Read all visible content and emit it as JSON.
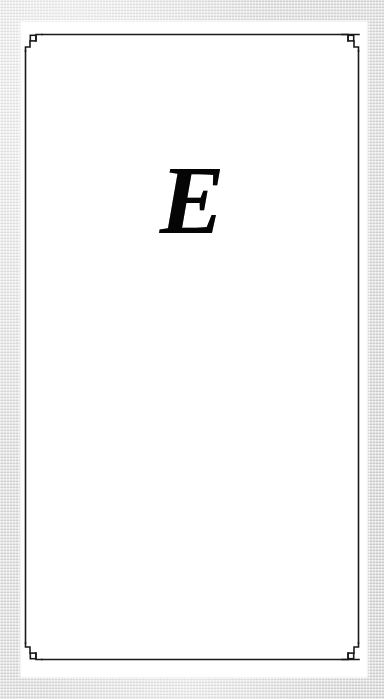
{
  "page": {
    "kind": "scanned-book-page",
    "role": "chapter-opening-page",
    "paper_color": "#ffffff",
    "scan_margin_color": "#dcdcdc",
    "ink_color": "#1a1a1a"
  },
  "drop_cap": {
    "character": "E",
    "style": "bold-italic-serif",
    "color": "#050505"
  },
  "frame": {
    "label": "ornamental rule border",
    "stroke_color": "#1a1a1a",
    "corners": [
      {
        "name": "top-left-corner-ornament"
      },
      {
        "name": "top-right-corner-ornament"
      },
      {
        "name": "bottom-left-corner-ornament"
      },
      {
        "name": "bottom-right-corner-ornament"
      }
    ]
  },
  "body_text": {
    "content": ""
  }
}
